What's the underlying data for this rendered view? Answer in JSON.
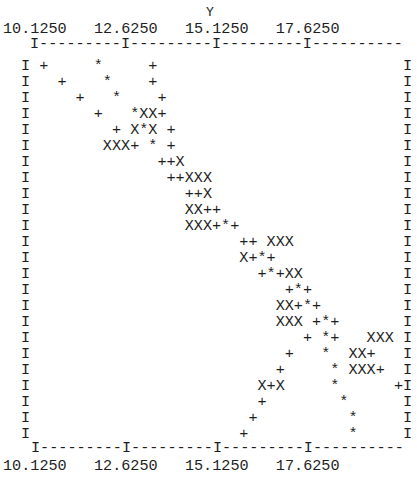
{
  "chart_data": {
    "type": "scatter",
    "style": "line-printer character plot",
    "title": "",
    "xlabel": "Y",
    "ylabel": "",
    "x_ticks": [
      "10.1250",
      "12.6250",
      "15.1250",
      "17.6250"
    ],
    "x_tick_interval": 2.5,
    "chars_per_tick_interval": 10,
    "xlim": [
      10.125,
      20.125
    ],
    "grid": false,
    "legend": null,
    "symbols": {
      "+": "series point",
      "X": "series point (alternate symbol)",
      "*": "overlapping / coincident points"
    },
    "n_rows": 24,
    "n_cols": 41,
    "points": [
      {
        "row": 0,
        "col": 1,
        "char": "+"
      },
      {
        "row": 0,
        "col": 7,
        "char": "*"
      },
      {
        "row": 0,
        "col": 13,
        "char": "+"
      },
      {
        "row": 1,
        "col": 3,
        "char": "+"
      },
      {
        "row": 1,
        "col": 8,
        "char": "*"
      },
      {
        "row": 1,
        "col": 13,
        "char": "+"
      },
      {
        "row": 2,
        "col": 5,
        "char": "+"
      },
      {
        "row": 2,
        "col": 9,
        "char": "*"
      },
      {
        "row": 2,
        "col": 14,
        "char": "+"
      },
      {
        "row": 3,
        "col": 7,
        "char": "+"
      },
      {
        "row": 3,
        "col": 11,
        "char": "*"
      },
      {
        "row": 3,
        "col": 12,
        "char": "X"
      },
      {
        "row": 3,
        "col": 13,
        "char": "X"
      },
      {
        "row": 3,
        "col": 14,
        "char": "+"
      },
      {
        "row": 4,
        "col": 9,
        "char": "+"
      },
      {
        "row": 4,
        "col": 11,
        "char": "X"
      },
      {
        "row": 4,
        "col": 12,
        "char": "*"
      },
      {
        "row": 4,
        "col": 13,
        "char": "X"
      },
      {
        "row": 4,
        "col": 15,
        "char": "+"
      },
      {
        "row": 5,
        "col": 8,
        "char": "X"
      },
      {
        "row": 5,
        "col": 9,
        "char": "X"
      },
      {
        "row": 5,
        "col": 10,
        "char": "X"
      },
      {
        "row": 5,
        "col": 11,
        "char": "+"
      },
      {
        "row": 5,
        "col": 13,
        "char": "*"
      },
      {
        "row": 5,
        "col": 15,
        "char": "+"
      },
      {
        "row": 6,
        "col": 14,
        "char": "+"
      },
      {
        "row": 6,
        "col": 15,
        "char": "+"
      },
      {
        "row": 6,
        "col": 16,
        "char": "X"
      },
      {
        "row": 7,
        "col": 15,
        "char": "+"
      },
      {
        "row": 7,
        "col": 16,
        "char": "+"
      },
      {
        "row": 7,
        "col": 17,
        "char": "X"
      },
      {
        "row": 7,
        "col": 18,
        "char": "X"
      },
      {
        "row": 7,
        "col": 19,
        "char": "X"
      },
      {
        "row": 8,
        "col": 17,
        "char": "+"
      },
      {
        "row": 8,
        "col": 18,
        "char": "+"
      },
      {
        "row": 8,
        "col": 19,
        "char": "X"
      },
      {
        "row": 9,
        "col": 17,
        "char": "X"
      },
      {
        "row": 9,
        "col": 18,
        "char": "X"
      },
      {
        "row": 9,
        "col": 19,
        "char": "+"
      },
      {
        "row": 9,
        "col": 20,
        "char": "+"
      },
      {
        "row": 10,
        "col": 17,
        "char": "X"
      },
      {
        "row": 10,
        "col": 18,
        "char": "X"
      },
      {
        "row": 10,
        "col": 19,
        "char": "X"
      },
      {
        "row": 10,
        "col": 20,
        "char": "+"
      },
      {
        "row": 10,
        "col": 21,
        "char": "*"
      },
      {
        "row": 10,
        "col": 22,
        "char": "+"
      },
      {
        "row": 11,
        "col": 23,
        "char": "+"
      },
      {
        "row": 11,
        "col": 24,
        "char": "+"
      },
      {
        "row": 11,
        "col": 26,
        "char": "X"
      },
      {
        "row": 11,
        "col": 27,
        "char": "X"
      },
      {
        "row": 11,
        "col": 28,
        "char": "X"
      },
      {
        "row": 12,
        "col": 23,
        "char": "X"
      },
      {
        "row": 12,
        "col": 24,
        "char": "+"
      },
      {
        "row": 12,
        "col": 25,
        "char": "*"
      },
      {
        "row": 12,
        "col": 26,
        "char": "+"
      },
      {
        "row": 13,
        "col": 25,
        "char": "+"
      },
      {
        "row": 13,
        "col": 26,
        "char": "*"
      },
      {
        "row": 13,
        "col": 27,
        "char": "+"
      },
      {
        "row": 13,
        "col": 28,
        "char": "X"
      },
      {
        "row": 13,
        "col": 29,
        "char": "X"
      },
      {
        "row": 14,
        "col": 28,
        "char": "+"
      },
      {
        "row": 14,
        "col": 29,
        "char": "*"
      },
      {
        "row": 14,
        "col": 30,
        "char": "+"
      },
      {
        "row": 15,
        "col": 27,
        "char": "X"
      },
      {
        "row": 15,
        "col": 28,
        "char": "X"
      },
      {
        "row": 15,
        "col": 29,
        "char": "+"
      },
      {
        "row": 15,
        "col": 30,
        "char": "*"
      },
      {
        "row": 15,
        "col": 31,
        "char": "+"
      },
      {
        "row": 16,
        "col": 27,
        "char": "X"
      },
      {
        "row": 16,
        "col": 28,
        "char": "X"
      },
      {
        "row": 16,
        "col": 29,
        "char": "X"
      },
      {
        "row": 16,
        "col": 31,
        "char": "+"
      },
      {
        "row": 16,
        "col": 32,
        "char": "*"
      },
      {
        "row": 16,
        "col": 33,
        "char": "+"
      },
      {
        "row": 17,
        "col": 30,
        "char": "+"
      },
      {
        "row": 17,
        "col": 32,
        "char": "*"
      },
      {
        "row": 17,
        "col": 33,
        "char": "+"
      },
      {
        "row": 17,
        "col": 37,
        "char": "X"
      },
      {
        "row": 17,
        "col": 38,
        "char": "X"
      },
      {
        "row": 17,
        "col": 39,
        "char": "X"
      },
      {
        "row": 18,
        "col": 28,
        "char": "+"
      },
      {
        "row": 18,
        "col": 32,
        "char": "*"
      },
      {
        "row": 18,
        "col": 35,
        "char": "X"
      },
      {
        "row": 18,
        "col": 36,
        "char": "X"
      },
      {
        "row": 18,
        "col": 37,
        "char": "+"
      },
      {
        "row": 19,
        "col": 27,
        "char": "+"
      },
      {
        "row": 19,
        "col": 33,
        "char": "*"
      },
      {
        "row": 19,
        "col": 35,
        "char": "X"
      },
      {
        "row": 19,
        "col": 36,
        "char": "X"
      },
      {
        "row": 19,
        "col": 37,
        "char": "X"
      },
      {
        "row": 19,
        "col": 38,
        "char": "+"
      },
      {
        "row": 20,
        "col": 25,
        "char": "X"
      },
      {
        "row": 20,
        "col": 26,
        "char": "+"
      },
      {
        "row": 20,
        "col": 27,
        "char": "X"
      },
      {
        "row": 20,
        "col": 33,
        "char": "*"
      },
      {
        "row": 20,
        "col": 40,
        "char": "+"
      },
      {
        "row": 21,
        "col": 25,
        "char": "+"
      },
      {
        "row": 21,
        "col": 34,
        "char": "*"
      },
      {
        "row": 22,
        "col": 24,
        "char": "+"
      },
      {
        "row": 22,
        "col": 35,
        "char": "*"
      },
      {
        "row": 23,
        "col": 23,
        "char": "+"
      },
      {
        "row": 23,
        "col": 35,
        "char": "*"
      }
    ],
    "grid_rows": [
      " +     *     +",
      "   +    *    +",
      "     +   *    +",
      "       +   *XX+",
      "         + X*X +",
      "        XXX+ * +",
      "              ++X",
      "               ++XXX",
      "                 ++X",
      "                 XX++",
      "                 XXX+*+",
      "                       ++ XXX",
      "                       X+*+",
      "                         +*+XX",
      "                            +*+",
      "                           XX+*+",
      "                           XXX +*+",
      "                              + *+   XXX",
      "                            +   *  XX+",
      "                           +     * XXX+",
      "                         X+X     *      +",
      "                         +        *",
      "                        +          *",
      "                       +           *"
    ]
  },
  "axis": {
    "title": "Y",
    "top_tick_labels": "10.1250   12.6250   15.1250   17.6250",
    "bottom_tick_labels": "10.1250   12.6250   15.1250   17.6250",
    "top_axis_line": "I---------I---------I---------I----------",
    "bottom_axis_line": "I---------I---------I---------I----------",
    "border_char": "I"
  }
}
